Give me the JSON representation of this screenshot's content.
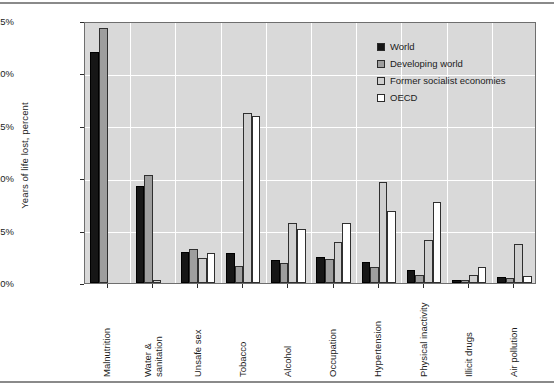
{
  "chart_data": {
    "type": "bar",
    "title": "",
    "xlabel": "",
    "ylabel": "Years of life lost, percent",
    "ylim": [
      0,
      25
    ],
    "ytick_labels": [
      "0%",
      "5%",
      "10%",
      "15%",
      "20%",
      "25%"
    ],
    "ytick_values": [
      0,
      5,
      10,
      15,
      20,
      25
    ],
    "grid": "horizontal-and-vertical-white",
    "legend_position": "top-right-inside",
    "categories": [
      "Malnutrition",
      "Water &\nsanitation",
      "Unsafe sex",
      "Tobacco",
      "Alcohol",
      "Occupation",
      "Hypertension",
      "Physical inactivity",
      "Illicit drugs",
      "Air pollution"
    ],
    "series": [
      {
        "name": "World",
        "color": "#161616",
        "values": [
          22.0,
          9.3,
          3.0,
          2.9,
          2.2,
          2.5,
          2.0,
          1.2,
          0.3,
          0.6
        ]
      },
      {
        "name": "Developing world",
        "color": "#9e9e9e",
        "values": [
          24.3,
          10.3,
          3.2,
          1.6,
          1.9,
          2.3,
          1.5,
          0.8,
          0.25,
          0.5
        ]
      },
      {
        "name": "Former socialist economies",
        "color": "#cfcfcf",
        "values": [
          0.0,
          0.3,
          2.4,
          16.2,
          5.7,
          3.9,
          9.6,
          4.1,
          0.75,
          3.7
        ]
      },
      {
        "name": "OECD",
        "color": "#ffffff",
        "values": [
          0.0,
          0.0,
          2.9,
          15.9,
          5.2,
          5.7,
          6.9,
          7.7,
          1.5,
          0.7
        ]
      }
    ]
  },
  "legend": {
    "items": [
      {
        "label": "World",
        "swatch": "#161616"
      },
      {
        "label": "Developing world",
        "swatch": "#9e9e9e"
      },
      {
        "label": "Former socialist economies",
        "swatch": "#cfcfcf"
      },
      {
        "label": "OECD",
        "swatch": "#ffffff"
      }
    ]
  }
}
